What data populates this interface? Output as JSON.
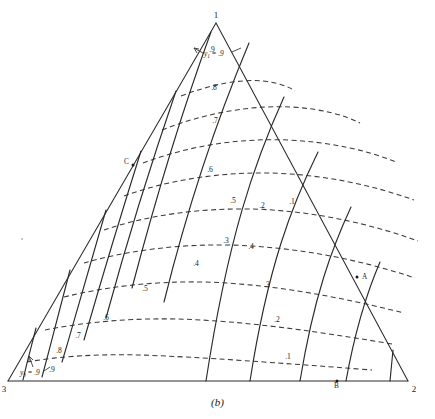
{
  "figure": {
    "caption": "(b)",
    "type": "ternary-diagram"
  },
  "vertices": {
    "top": "1",
    "bottom_left": "3",
    "bottom_right": "2"
  },
  "points": [
    {
      "id": "A",
      "label": "A",
      "x": 360,
      "y": 278
    },
    {
      "id": "B",
      "label": "B",
      "x": 337,
      "y": 381
    },
    {
      "id": "C",
      "label": "C",
      "x": 131,
      "y": 163
    }
  ],
  "annotations": [
    {
      "id": "y1",
      "text": "y",
      "sub": "1",
      "value": "= .9"
    },
    {
      "id": "y3",
      "text": "y",
      "sub": "3",
      "value": "= .9"
    }
  ],
  "chart_data": {
    "type": "line",
    "title": "",
    "subtitle": "",
    "xlabel": "",
    "ylabel": "",
    "legend": [],
    "grid": false,
    "axis_note": "Ternary composition triangle with vertices 1 (top), 2 (bottom right), 3 (bottom left)",
    "families": [
      {
        "name": "dashed-contours",
        "style": "dashed",
        "description": "Family of dashed curves running roughly horizontally, labelled .1 through .9 from bottom to top",
        "labels": [
          ".9",
          ".8",
          ".7",
          ".6",
          ".5",
          ".4",
          ".3",
          ".2",
          ".1"
        ],
        "values": [
          0.9,
          0.8,
          0.7,
          0.6,
          0.5,
          0.4,
          0.3,
          0.2,
          0.1
        ]
      },
      {
        "name": "solid-contours",
        "style": "solid",
        "description": "Family of solid curves fanning from upper right toward lower left, labelled .1 through .9",
        "labels": [
          ".1",
          ".2",
          ".3",
          ".4",
          ".5",
          ".6",
          ".7",
          ".8",
          ".9"
        ],
        "values": [
          0.1,
          0.2,
          0.3,
          0.4,
          0.5,
          0.6,
          0.7,
          0.8,
          0.9
        ]
      }
    ],
    "dashed_labels": [
      {
        "text": ".9",
        "x": 52,
        "y": 372
      },
      {
        "text": ".8",
        "x": 59,
        "y": 353
      },
      {
        "text": ".7",
        "x": 78,
        "y": 338
      },
      {
        "text": ".6",
        "x": 106,
        "y": 320
      },
      {
        "text": ".5",
        "x": 145,
        "y": 291
      },
      {
        "text": ".4",
        "x": 196,
        "y": 266
      },
      {
        "text": ".3",
        "x": 226,
        "y": 243
      },
      {
        "text": ".2",
        "x": 262,
        "y": 208
      },
      {
        "text": ".1",
        "x": 292,
        "y": 204
      }
    ],
    "solid_labels": [
      {
        "text": ".9",
        "x": 212,
        "y": 52
      },
      {
        "text": ".8",
        "x": 214,
        "y": 90
      },
      {
        "text": ".7",
        "x": 215,
        "y": 123
      },
      {
        "text": ".6",
        "x": 210,
        "y": 172
      },
      {
        "text": ".5",
        "x": 233,
        "y": 203
      },
      {
        "text": ".4",
        "x": 251,
        "y": 249
      },
      {
        "text": ".3",
        "x": 267,
        "y": 287
      },
      {
        "text": ".2",
        "x": 277,
        "y": 322
      },
      {
        "text": ".1",
        "x": 288,
        "y": 359
      }
    ]
  }
}
